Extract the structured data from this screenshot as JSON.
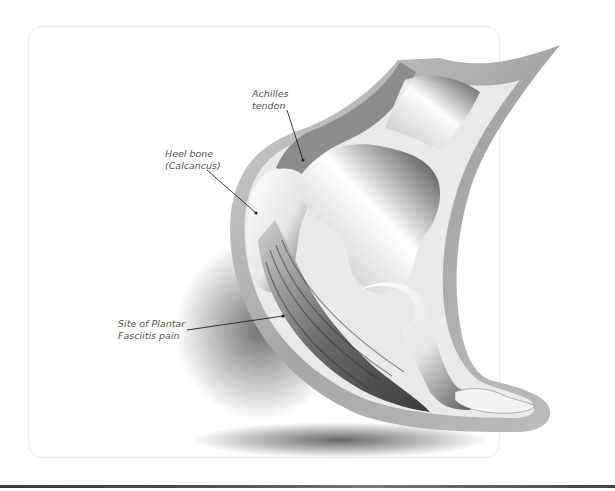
{
  "diagram": {
    "labels": [
      {
        "id": "achilles",
        "line1": "Achilles",
        "line2": "tendon"
      },
      {
        "id": "heel",
        "line1": "Heel bone",
        "line2": "(Calcancus)"
      },
      {
        "id": "plantar",
        "line1": "Site of Plantar",
        "line2": "Fasciitis pain"
      }
    ],
    "colors": {
      "skin": "#a9a9a9",
      "bone_highlight": "#ffffff",
      "bone_shadow": "#3c3c3c",
      "leader_line": "#222222",
      "label_text": "#555555",
      "frame_border": "#ececec"
    }
  }
}
